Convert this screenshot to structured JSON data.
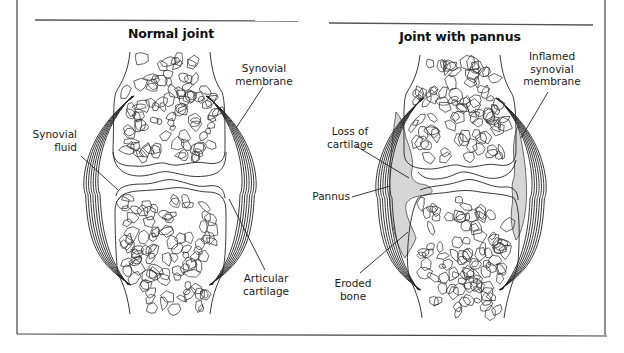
{
  "figure": {
    "frame_color": "#444444",
    "line_color": "#222222",
    "pannus_fill": "#d9d9d9"
  },
  "panels": [
    {
      "id": "normal",
      "title": "Normal joint",
      "labels": [
        {
          "id": "synovial-membrane",
          "lines": [
            "Synovial",
            "membrane"
          ]
        },
        {
          "id": "synovial-fluid",
          "lines": [
            "Synovial",
            "fluid"
          ]
        },
        {
          "id": "articular-cartilage",
          "lines": [
            "Articular",
            "cartilage"
          ]
        }
      ]
    },
    {
      "id": "pannus",
      "title": "Joint with pannus",
      "labels": [
        {
          "id": "inflamed-synovial-membrane",
          "lines": [
            "Inflamed",
            "synovial",
            "membrane"
          ]
        },
        {
          "id": "loss-of-cartilage",
          "lines": [
            "Loss of",
            "cartilage"
          ]
        },
        {
          "id": "pannus",
          "lines": [
            "Pannus"
          ]
        },
        {
          "id": "eroded-bone",
          "lines": [
            "Eroded",
            "bone"
          ]
        }
      ]
    }
  ]
}
